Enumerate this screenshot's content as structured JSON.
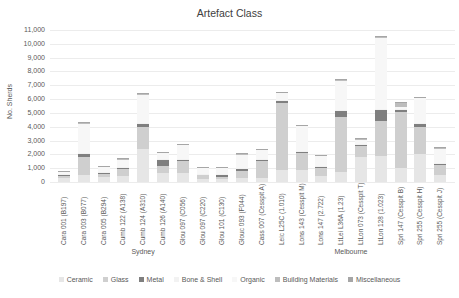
{
  "chart_data": {
    "type": "bar",
    "stacked": true,
    "title": "Artefact Class",
    "xlabel": "",
    "ylabel": "No. Sherds",
    "ylim": [
      0,
      11000
    ],
    "yticks": [
      "0",
      "1,000",
      "2,000",
      "3,000",
      "4,000",
      "5,000",
      "6,000",
      "7,000",
      "8,000",
      "9,000",
      "10,000",
      "11,000"
    ],
    "grid": true,
    "legend_position": "bottom",
    "groups": [
      {
        "name": "Sydney",
        "count": 9
      },
      {
        "name": "Melbourne",
        "count": 12
      }
    ],
    "categories": [
      "Cara 001 (B197)",
      "Cara 003 (B077)",
      "Cara 005 (B294)",
      "Cumb 122 (A138)",
      "Cumb 124 (A310)",
      "Cumb 126 (A140)",
      "Glou 097 (C056)",
      "Glou 097 (C220)",
      "Glou 101 (C130)",
      "Glouc 093 (F044)",
      "Cass 007  (Cesspit A)",
      "Leic L25C (1.010)",
      "Lons 143 (Cesspit M)",
      "Lons 147  (2.722)",
      "LtLei L36A (1.23)",
      "LtLon 073 (Cesspit T)",
      "LtLon 128  (1.023)",
      "Spri 147 (Cesspit B)",
      "Spri 255 (Cesspit H)",
      "Spri 255 (Cesspit J)"
    ],
    "series": [
      {
        "name": "Ceramic",
        "color": "#e6e6e6",
        "values": [
          300,
          500,
          350,
          450,
          2400,
          650,
          650,
          250,
          200,
          300,
          300,
          900,
          900,
          400,
          700,
          1800,
          1900,
          1000,
          2000,
          500
        ]
      },
      {
        "name": "Glass",
        "color": "#cfcfcf",
        "values": [
          150,
          1300,
          250,
          500,
          1600,
          500,
          850,
          250,
          150,
          500,
          1200,
          4800,
          1200,
          600,
          4000,
          800,
          2500,
          4100,
          2000,
          750
        ]
      },
      {
        "name": "Metal",
        "color": "#7f7f7f",
        "values": [
          80,
          250,
          100,
          100,
          200,
          450,
          150,
          50,
          150,
          150,
          80,
          150,
          80,
          80,
          450,
          80,
          850,
          100,
          200,
          100
        ]
      },
      {
        "name": "Bone & Shell",
        "color": "#f2f2f2",
        "values": [
          50,
          50,
          50,
          50,
          50,
          50,
          50,
          50,
          50,
          50,
          50,
          50,
          50,
          50,
          50,
          50,
          50,
          50,
          50,
          50
        ]
      },
      {
        "name": "Organic",
        "color": "#f7f7f7",
        "values": [
          150,
          2100,
          350,
          550,
          2100,
          450,
          1000,
          450,
          500,
          1000,
          700,
          550,
          1800,
          750,
          2150,
          350,
          5150,
          200,
          1850,
          1050
        ]
      },
      {
        "name": "Building Materials",
        "color": "#bdbdbd",
        "values": [
          30,
          100,
          50,
          50,
          50,
          50,
          60,
          30,
          30,
          50,
          60,
          60,
          60,
          60,
          60,
          60,
          60,
          300,
          50,
          30
        ]
      },
      {
        "name": "Miscellaneous",
        "color": "#a6a6a6",
        "values": [
          20,
          20,
          20,
          20,
          20,
          20,
          20,
          20,
          20,
          20,
          20,
          20,
          20,
          20,
          20,
          20,
          20,
          20,
          20,
          20
        ]
      }
    ]
  },
  "labels": {
    "title": "Artefact Class",
    "ylabel": "No. Sherds"
  }
}
